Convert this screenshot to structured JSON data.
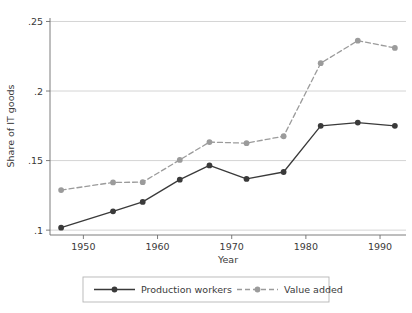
{
  "chart_data": {
    "type": "line",
    "title": "",
    "subtitle": "",
    "xlabel": "Year",
    "ylabel": "Share of IT goods",
    "xlim": [
      1945.5,
      1993.5
    ],
    "ylim": [
      0.0965,
      0.2525
    ],
    "grid": true,
    "gridlines_y": [
      0.1,
      0.15,
      0.2,
      0.25
    ],
    "xticks": [
      1950,
      1960,
      1970,
      1980,
      1990
    ],
    "xtick_labels": [
      "1950",
      "1960",
      "1970",
      "1980",
      "1990"
    ],
    "yticks": [
      0.1,
      0.15,
      0.2,
      0.25
    ],
    "ytick_labels": [
      ".1",
      ".15",
      ".2",
      ".25"
    ],
    "legend_position": "bottom",
    "x": [
      1947,
      1954,
      1958,
      1963,
      1967,
      1972,
      1977,
      1982,
      1987,
      1992
    ],
    "series": [
      {
        "name": "Production workers",
        "style": "solid",
        "color": "#3a3a3a",
        "marker": "circle",
        "values": [
          0.1018,
          0.1135,
          0.1203,
          0.1363,
          0.1465,
          0.1368,
          0.1418,
          0.175,
          0.1773,
          0.175
        ]
      },
      {
        "name": "Value added",
        "style": "dashed",
        "color": "#9b9b9b",
        "marker": "circle",
        "values": [
          0.1288,
          0.1343,
          0.1345,
          0.1505,
          0.1633,
          0.1625,
          0.1675,
          0.22,
          0.2362,
          0.231
        ]
      }
    ]
  },
  "axes": {
    "y_axis_title": "Share of IT goods",
    "x_axis_title": "Year"
  },
  "legend": {
    "entries": [
      {
        "label": "Production workers"
      },
      {
        "label": "Value added"
      }
    ]
  },
  "colors": {
    "series_production_workers": "#3a3a3a",
    "series_value_added": "#9b9b9b",
    "gridline": "#c9c9c9",
    "axis": "#6e6e6e",
    "legend_border": "#b5b5b5",
    "text": "#3a3a3a",
    "background": "#ffffff"
  }
}
